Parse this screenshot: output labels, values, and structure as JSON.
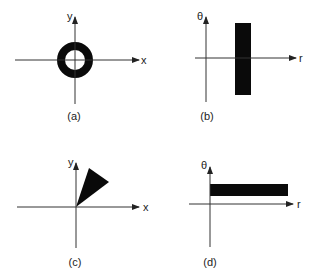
{
  "figure": {
    "panels": [
      {
        "id": "a",
        "caption": "(a)",
        "x_label": "x",
        "y_label": "y",
        "axes": {
          "origin": [
            75,
            60
          ],
          "h_from": 15,
          "h_to": 139,
          "v_from": 17,
          "v_to": 104
        },
        "shape": {
          "type": "ring",
          "cx": 75,
          "cy": 60,
          "r_outer": 18,
          "r_inner": 10
        },
        "caption_pos": [
          74,
          120
        ],
        "xlabel_pos": [
          143,
          64
        ],
        "ylabel_pos": [
          68,
          19
        ]
      },
      {
        "id": "b",
        "caption": "(b)",
        "x_label": "r",
        "y_label": "θ",
        "axes": {
          "origin": [
            206,
            58
          ],
          "h_from": 195,
          "h_to": 296,
          "v_from": 17,
          "v_to": 102
        },
        "shape": {
          "type": "rect",
          "x": 235,
          "y": 23,
          "w": 16,
          "h": 72
        },
        "caption_pos": [
          207,
          120
        ],
        "xlabel_pos": [
          301,
          62
        ],
        "ylabel_pos": [
          200,
          19
        ]
      },
      {
        "id": "c",
        "caption": "(c)",
        "x_label": "x",
        "y_label": "y",
        "axes": {
          "origin": [
            76,
            207
          ],
          "h_from": 17,
          "h_to": 139,
          "v_from": 163,
          "v_to": 248
        },
        "shape": {
          "type": "wedge",
          "points": [
            [
              76,
              207
            ],
            [
              89,
              168
            ],
            [
              109,
              182
            ]
          ]
        },
        "caption_pos": [
          75,
          266
        ],
        "xlabel_pos": [
          145,
          211
        ],
        "ylabel_pos": [
          69,
          167
        ]
      },
      {
        "id": "d",
        "caption": "(d)",
        "x_label": "r",
        "y_label": "θ",
        "axes": {
          "origin": [
            210,
            204
          ],
          "h_from": 189,
          "h_to": 293,
          "v_from": 167,
          "v_to": 247
        },
        "shape": {
          "type": "rect",
          "x": 210,
          "y": 184,
          "w": 78,
          "h": 12
        },
        "caption_pos": [
          210,
          266
        ],
        "xlabel_pos": [
          299,
          208
        ],
        "ylabel_pos": [
          204,
          168
        ]
      }
    ],
    "colors": {
      "shape": "#0a0a0a",
      "axis": "#333333",
      "background": "#ffffff"
    }
  }
}
